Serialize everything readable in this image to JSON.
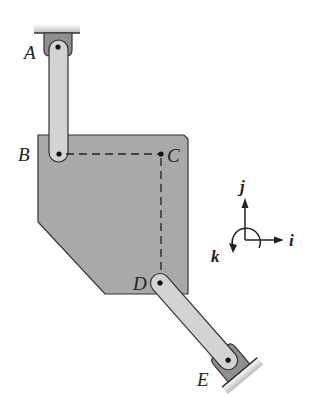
{
  "diagram": {
    "labels": {
      "A": "A",
      "B": "B",
      "C": "C",
      "D": "D",
      "E": "E"
    },
    "axes": {
      "i": "i",
      "j": "j",
      "k": "k"
    },
    "colors": {
      "plate": "#a9a9a9",
      "link": "#d3d3d3",
      "support": "#8f8f8f",
      "outline": "#333333"
    }
  }
}
